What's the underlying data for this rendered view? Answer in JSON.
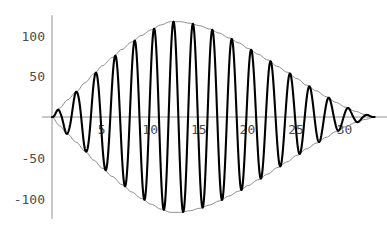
{
  "chart_data": {
    "type": "line",
    "title": "",
    "subtitle": "",
    "xlabel": "",
    "ylabel": "",
    "xlim": [
      0,
      34.5
    ],
    "ylim": [
      -125,
      125
    ],
    "grid": false,
    "legend": null,
    "background_color": "#ffffff",
    "axis_color": "#909090",
    "curve_color": "#000000",
    "envelope_color": "#8c8c8c",
    "tick_label_color": "#4d4d4d",
    "x_ticks": [
      5,
      10,
      15,
      20,
      25,
      30
    ],
    "x_tick_labels": [
      "5",
      "10",
      "15",
      "20",
      "25",
      "30"
    ],
    "y_ticks": [
      100,
      50,
      -50,
      -100
    ],
    "y_tick_labels": [
      "100",
      "50",
      "-50",
      "-100"
    ],
    "series": [
      {
        "name": "oscillation",
        "style": "thick-black",
        "carrier_period": 2.0,
        "carrier_frequency": 3.14159,
        "envelope_peak_value": 117,
        "envelope_peak_x": 12.2,
        "envelope_zero_start_x": 0,
        "envelope_zero_end_x": 33.2
      },
      {
        "name": "upper-envelope",
        "style": "thin-gray"
      },
      {
        "name": "lower-envelope",
        "style": "thin-gray"
      }
    ],
    "envelope_points": [
      {
        "x": 0.0,
        "y": 0
      },
      {
        "x": 0.8,
        "y": 11
      },
      {
        "x": 1.6,
        "y": 21
      },
      {
        "x": 2.5,
        "y": 31
      },
      {
        "x": 3.4,
        "y": 42
      },
      {
        "x": 4.3,
        "y": 53
      },
      {
        "x": 5.2,
        "y": 63
      },
      {
        "x": 6.2,
        "y": 73
      },
      {
        "x": 7.2,
        "y": 83
      },
      {
        "x": 8.2,
        "y": 92
      },
      {
        "x": 9.2,
        "y": 100
      },
      {
        "x": 10.2,
        "y": 107
      },
      {
        "x": 11.2,
        "y": 113
      },
      {
        "x": 12.2,
        "y": 117
      },
      {
        "x": 13.2,
        "y": 117
      },
      {
        "x": 14.2,
        "y": 115
      },
      {
        "x": 15.2,
        "y": 112
      },
      {
        "x": 16.2,
        "y": 108
      },
      {
        "x": 17.2,
        "y": 103
      },
      {
        "x": 18.2,
        "y": 97
      },
      {
        "x": 19.2,
        "y": 91
      },
      {
        "x": 20.2,
        "y": 84
      },
      {
        "x": 21.2,
        "y": 77
      },
      {
        "x": 22.2,
        "y": 70
      },
      {
        "x": 23.2,
        "y": 62
      },
      {
        "x": 24.2,
        "y": 55
      },
      {
        "x": 25.2,
        "y": 47
      },
      {
        "x": 26.2,
        "y": 39
      },
      {
        "x": 27.2,
        "y": 32
      },
      {
        "x": 28.2,
        "y": 25
      },
      {
        "x": 29.2,
        "y": 18
      },
      {
        "x": 30.2,
        "y": 12
      },
      {
        "x": 31.2,
        "y": 7
      },
      {
        "x": 32.2,
        "y": 3
      },
      {
        "x": 33.2,
        "y": 0
      }
    ]
  }
}
